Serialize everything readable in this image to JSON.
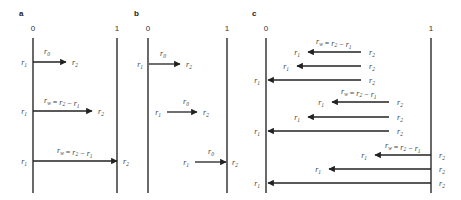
{
  "figure": {
    "panels": [
      {
        "label": "a",
        "axis_left": "0",
        "axis_right": "1",
        "left_x": 33,
        "right_x": 117,
        "arrows": [
          {
            "y": 62,
            "from": 33,
            "to": 66,
            "dir": "right",
            "start_label": "r1",
            "end_label": "r2",
            "above": "r0",
            "above_x": 44
          },
          {
            "y": 111,
            "from": 33,
            "to": 92,
            "dir": "right",
            "start_label": "r1",
            "end_label": "r2",
            "above": "rw = r2 − r1",
            "above_x": 44
          },
          {
            "y": 161,
            "from": 33,
            "to": 117,
            "dir": "right",
            "start_label": "r1",
            "end_label": "r2",
            "above": "rw = r2 − r1",
            "above_x": 57
          }
        ]
      },
      {
        "label": "b",
        "axis_left": "0",
        "axis_right": "1",
        "left_x": 148,
        "right_x": 227,
        "arrows": [
          {
            "y": 64,
            "from": 149,
            "to": 180,
            "dir": "right",
            "start_label": "r1",
            "end_label": "r2",
            "above": "r0",
            "above_x": 160
          },
          {
            "y": 112,
            "from": 167,
            "to": 197,
            "dir": "right",
            "start_label": "r1",
            "end_label": "r2",
            "above": "r0",
            "above_x": 183
          },
          {
            "y": 162,
            "from": 195,
            "to": 226,
            "dir": "right",
            "start_label": "r1",
            "end_label": "r2",
            "above": "r0",
            "above_x": 208
          }
        ]
      },
      {
        "label": "c",
        "axis_left": "0",
        "axis_right": "1",
        "left_x": 266,
        "right_x": 431,
        "groups": [
          {
            "above": "rw = r2 − r1",
            "above_x": 316,
            "above_y": 44,
            "arrows": [
              {
                "y": 52,
                "from": 361,
                "to": 308,
                "end_label": "r1",
                "start_label": "r2"
              },
              {
                "y": 66,
                "from": 361,
                "to": 297,
                "end_label": "r1",
                "start_label": "r2"
              },
              {
                "y": 80,
                "from": 361,
                "to": 268,
                "end_label": "r1",
                "start_label": "r2"
              }
            ]
          },
          {
            "above": "rw = r2 − r1",
            "above_x": 341,
            "above_y": 94,
            "arrows": [
              {
                "y": 102,
                "from": 389,
                "to": 332,
                "end_label": "r1",
                "start_label": "r2"
              },
              {
                "y": 117,
                "from": 389,
                "to": 308,
                "end_label": "r1",
                "start_label": "r2"
              },
              {
                "y": 131,
                "from": 389,
                "to": 268,
                "end_label": "r1",
                "start_label": "r2"
              }
            ]
          },
          {
            "above": "rw = r2 − r1",
            "above_x": 385,
            "above_y": 148,
            "arrows": [
              {
                "y": 155,
                "from": 431,
                "to": 375,
                "end_label": "r1",
                "start_label": "r2"
              },
              {
                "y": 169,
                "from": 431,
                "to": 329,
                "end_label": "r1",
                "start_label": "r2"
              },
              {
                "y": 183,
                "from": 431,
                "to": 268,
                "end_label": "r1",
                "start_label": "r2"
              }
            ]
          }
        ]
      }
    ]
  },
  "text": {
    "r0": [
      "r",
      "0"
    ],
    "r1": [
      "r",
      "1"
    ],
    "r2": [
      "r",
      "2"
    ],
    "rw": [
      "r",
      "w"
    ]
  }
}
